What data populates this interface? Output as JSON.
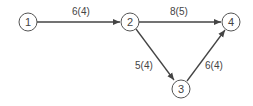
{
  "diagram": {
    "type": "directed-network",
    "nodes": [
      {
        "id": "1",
        "label": "1",
        "x": 28,
        "y": 22
      },
      {
        "id": "2",
        "label": "2",
        "x": 130,
        "y": 22
      },
      {
        "id": "3",
        "label": "3",
        "x": 181,
        "y": 89
      },
      {
        "id": "4",
        "label": "4",
        "x": 231,
        "y": 22
      }
    ],
    "edges": [
      {
        "from": "1",
        "to": "2",
        "label": "6(4)"
      },
      {
        "from": "2",
        "to": "4",
        "label": "8(5)"
      },
      {
        "from": "2",
        "to": "3",
        "label": "5(4)"
      },
      {
        "from": "3",
        "to": "4",
        "label": "6(4)"
      }
    ],
    "colors": {
      "stroke": "#444444",
      "background": "#ffffff"
    }
  }
}
